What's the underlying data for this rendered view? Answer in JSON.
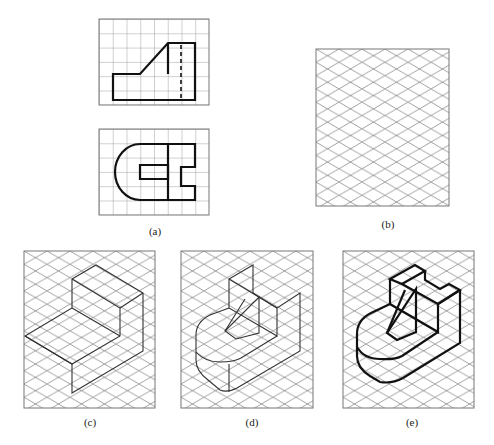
{
  "figure": {
    "panels": [
      {
        "id": "a",
        "label": "(a)",
        "content": "Two orthographic views (front view above, top view below) drawn on square grids"
      },
      {
        "id": "b",
        "label": "(b)",
        "content": "Blank isometric grid"
      },
      {
        "id": "c",
        "label": "(c)",
        "content": "Bounding boxes blocked in on isometric grid"
      },
      {
        "id": "d",
        "label": "(d)",
        "content": "Details added: rounded end, slot, inclined rib"
      },
      {
        "id": "e",
        "label": "(e)",
        "content": "Final isometric sketch with visible edges darkened"
      }
    ],
    "square_grid": {
      "front_view": {
        "cols": 8,
        "rows": 6
      },
      "top_view": {
        "cols": 8,
        "rows": 6
      }
    },
    "colors": {
      "grid": "#8a8a8a",
      "outline": "#111111",
      "construction": "#333333"
    }
  }
}
